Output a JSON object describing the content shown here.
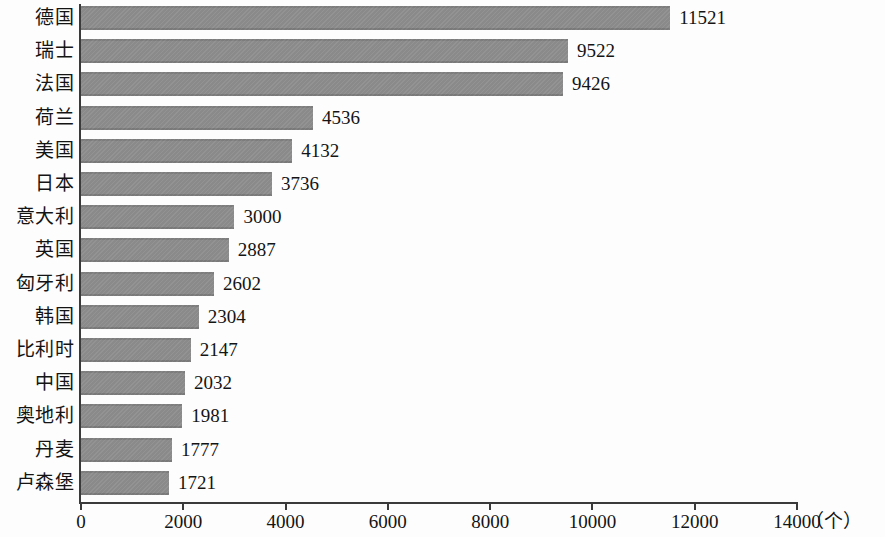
{
  "chart_data": {
    "type": "bar",
    "orientation": "horizontal",
    "title": "",
    "subtitle": "",
    "xlabel": "（个）",
    "ylabel": "",
    "categories": [
      "德国",
      "瑞士",
      "法国",
      "荷兰",
      "美国",
      "日本",
      "意大利",
      "英国",
      "匈牙利",
      "韩国",
      "比利时",
      "中国",
      "奥地利",
      "丹麦",
      "卢森堡"
    ],
    "values": [
      11521,
      9522,
      9426,
      4536,
      4132,
      3736,
      3000,
      2887,
      2602,
      2304,
      2147,
      2032,
      1981,
      1777,
      1721
    ],
    "data_labels": [
      "11521",
      "9522",
      "9426",
      "4536",
      "4132",
      "3736",
      "3000",
      "2887",
      "2602",
      "2304",
      "2147",
      "2032",
      "1981",
      "1777",
      "1721"
    ],
    "xlim": [
      0,
      14000
    ],
    "xticks": [
      0,
      2000,
      4000,
      6000,
      8000,
      10000,
      12000,
      14000
    ],
    "xtick_labels": [
      "0",
      "2000",
      "4000",
      "6000",
      "8000",
      "10000",
      "12000",
      "14000"
    ],
    "grid": false,
    "legend": null,
    "bar_color": "#8d8d8d",
    "axis_color": "#3a3a3a",
    "text_color": "#141414",
    "background_color": "#fdfdfd"
  }
}
